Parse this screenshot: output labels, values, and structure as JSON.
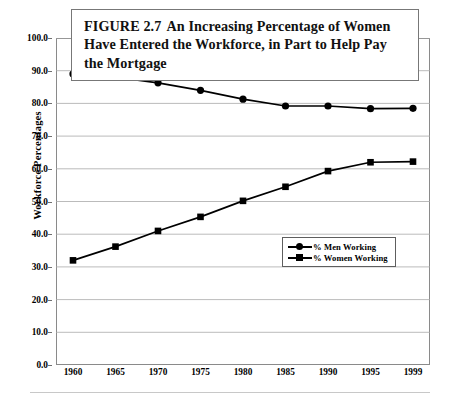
{
  "figure": {
    "title_number": "FIGURE 2.7",
    "title_text": "An Increasing Percentage of Women Have Entered the Workforce, in Part to Help Pay the Mortgage"
  },
  "chart_data": {
    "type": "line",
    "xlabel": "",
    "ylabel": "Workforce Percentages",
    "categories": [
      "1960",
      "1965",
      "1970",
      "1975",
      "1980",
      "1985",
      "1990",
      "1995",
      "1999"
    ],
    "series": [
      {
        "name": "% Men Working",
        "marker": "circle",
        "color": "#000000",
        "values": [
          89.0,
          88.0,
          86.3,
          84.0,
          81.3,
          79.2,
          79.2,
          78.4,
          78.5
        ]
      },
      {
        "name": "% Women Working",
        "marker": "square",
        "color": "#000000",
        "values": [
          32.0,
          36.2,
          41.0,
          45.3,
          50.2,
          54.5,
          59.3,
          62.0,
          62.2
        ]
      }
    ],
    "ylim": [
      0.0,
      100.0
    ],
    "ytick_step": 10.0,
    "yticks": [
      "100.0",
      "90.0",
      "80.0",
      "70.0",
      "60.0",
      "50.0",
      "40.0",
      "30.0",
      "20.0",
      "10.0",
      "0.0"
    ],
    "grid": "horizontal",
    "legend_position": "center-right-inside"
  },
  "legend": {
    "items": [
      {
        "label": "% Men Working",
        "marker": "circle"
      },
      {
        "label": "% Women Working",
        "marker": "square"
      }
    ]
  }
}
